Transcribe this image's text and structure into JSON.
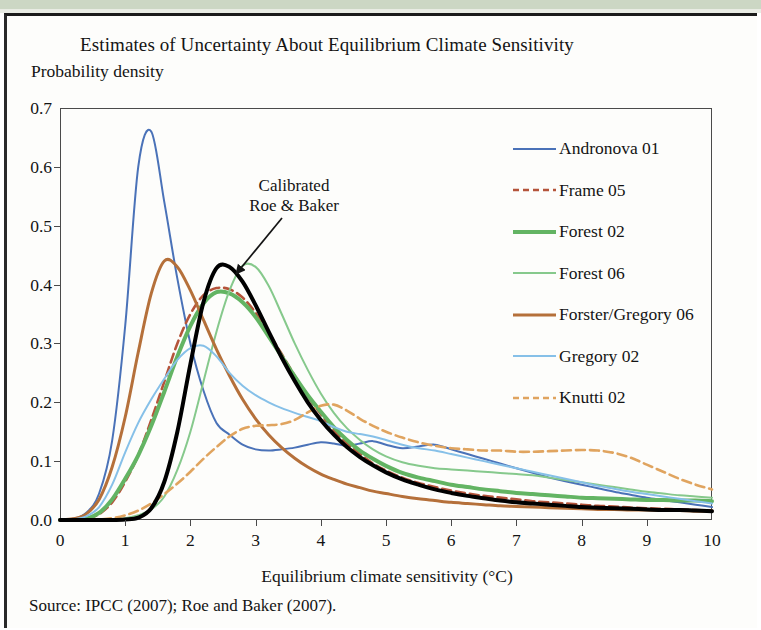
{
  "figure": {
    "title": "Estimates of Uncertainty About Equilibrium Climate Sensitivity",
    "y_axis_title": "Probability density",
    "x_axis_title": "Equilibrium climate sensitivity (°C)",
    "source_note": "Source: IPCC (2007); Roe and Baker (2007).",
    "annotation_line1": "Calibrated",
    "annotation_line2": "Roe & Baker"
  },
  "chart_data": {
    "type": "line",
    "title": "Estimates of Uncertainty About Equilibrium Climate Sensitivity",
    "xlabel": "Equilibrium climate sensitivity (°C)",
    "ylabel": "Probability density",
    "xlim": [
      0,
      10
    ],
    "ylim": [
      0,
      0.7
    ],
    "xticks": [
      "0",
      "1",
      "2",
      "3",
      "4",
      "5",
      "6",
      "7",
      "8",
      "9",
      "10"
    ],
    "yticks": [
      "0.0",
      "0.1",
      "0.2",
      "0.3",
      "0.4",
      "0.5",
      "0.6",
      "0.7"
    ],
    "grid": false,
    "legend_position": "right",
    "x": [
      0.0,
      0.2,
      0.4,
      0.6,
      0.8,
      1.0,
      1.2,
      1.4,
      1.6,
      1.8,
      2.0,
      2.2,
      2.4,
      2.6,
      2.8,
      3.0,
      3.2,
      3.4,
      3.6,
      3.8,
      4.0,
      4.2,
      4.4,
      4.6,
      4.8,
      5.0,
      5.25,
      5.5,
      5.75,
      6.0,
      6.25,
      6.5,
      6.75,
      7.0,
      7.25,
      7.5,
      7.75,
      8.0,
      8.25,
      8.5,
      8.75,
      9.0,
      9.25,
      9.5,
      9.75,
      10.0
    ],
    "series": [
      {
        "name": "Andronova 01",
        "color": "#4a72b8",
        "style": "solid",
        "width": 2.0,
        "peak_x": 1.3,
        "peak_y": 0.665,
        "values": [
          0.0,
          0.002,
          0.012,
          0.045,
          0.135,
          0.33,
          0.6,
          0.66,
          0.54,
          0.41,
          0.3,
          0.22,
          0.165,
          0.145,
          0.128,
          0.12,
          0.118,
          0.12,
          0.123,
          0.128,
          0.132,
          0.13,
          0.126,
          0.13,
          0.134,
          0.128,
          0.122,
          0.125,
          0.128,
          0.12,
          0.112,
          0.104,
          0.096,
          0.088,
          0.08,
          0.072,
          0.066,
          0.06,
          0.054,
          0.048,
          0.043,
          0.038,
          0.034,
          0.03,
          0.026,
          0.022
        ]
      },
      {
        "name": "Frame 05",
        "color": "#b5543a",
        "style": "dashed",
        "width": 2.6,
        "peak_x": 2.35,
        "peak_y": 0.395,
        "values": [
          0.0,
          0.0,
          0.002,
          0.01,
          0.03,
          0.065,
          0.11,
          0.17,
          0.235,
          0.3,
          0.35,
          0.382,
          0.394,
          0.392,
          0.378,
          0.352,
          0.318,
          0.282,
          0.245,
          0.21,
          0.18,
          0.152,
          0.13,
          0.112,
          0.096,
          0.084,
          0.072,
          0.063,
          0.056,
          0.05,
          0.045,
          0.041,
          0.038,
          0.035,
          0.032,
          0.03,
          0.028,
          0.026,
          0.024,
          0.023,
          0.021,
          0.02,
          0.019,
          0.018,
          0.017,
          0.016
        ]
      },
      {
        "name": "Forest 02",
        "color": "#63b463",
        "style": "solid",
        "width": 4.0,
        "peak_x": 2.4,
        "peak_y": 0.388,
        "values": [
          0.0,
          0.0,
          0.002,
          0.012,
          0.035,
          0.07,
          0.11,
          0.16,
          0.218,
          0.278,
          0.33,
          0.368,
          0.387,
          0.385,
          0.37,
          0.345,
          0.312,
          0.278,
          0.244,
          0.212,
          0.184,
          0.158,
          0.136,
          0.118,
          0.104,
          0.092,
          0.08,
          0.072,
          0.066,
          0.06,
          0.056,
          0.052,
          0.049,
          0.046,
          0.044,
          0.042,
          0.04,
          0.038,
          0.037,
          0.036,
          0.035,
          0.034,
          0.034,
          0.033,
          0.033,
          0.032
        ]
      },
      {
        "name": "Forest 06",
        "color": "#86c98c",
        "style": "solid",
        "width": 2.0,
        "peak_x": 2.92,
        "peak_y": 0.437,
        "values": [
          0.0,
          0.0,
          0.0,
          0.0,
          0.001,
          0.003,
          0.008,
          0.018,
          0.04,
          0.085,
          0.15,
          0.235,
          0.32,
          0.39,
          0.432,
          0.43,
          0.398,
          0.35,
          0.3,
          0.255,
          0.215,
          0.182,
          0.156,
          0.136,
          0.12,
          0.108,
          0.098,
          0.092,
          0.088,
          0.086,
          0.084,
          0.082,
          0.08,
          0.078,
          0.076,
          0.072,
          0.068,
          0.064,
          0.06,
          0.056,
          0.052,
          0.048,
          0.045,
          0.042,
          0.04,
          0.038
        ]
      },
      {
        "name": "Forster/Gregory 06",
        "color": "#b5703a",
        "style": "solid",
        "width": 3.0,
        "peak_x": 1.62,
        "peak_y": 0.443,
        "values": [
          0.0,
          0.002,
          0.01,
          0.035,
          0.09,
          0.175,
          0.285,
          0.385,
          0.44,
          0.43,
          0.39,
          0.34,
          0.29,
          0.245,
          0.205,
          0.172,
          0.145,
          0.123,
          0.105,
          0.09,
          0.078,
          0.069,
          0.061,
          0.055,
          0.049,
          0.045,
          0.04,
          0.036,
          0.033,
          0.03,
          0.028,
          0.026,
          0.024,
          0.023,
          0.022,
          0.021,
          0.02,
          0.019,
          0.018,
          0.018,
          0.017,
          0.017,
          0.016,
          0.016,
          0.015,
          0.015
        ]
      },
      {
        "name": "Gregory 02",
        "color": "#86c0e8",
        "style": "solid",
        "width": 2.0,
        "peak_x": 2.15,
        "peak_y": 0.297,
        "values": [
          0.0,
          0.001,
          0.006,
          0.022,
          0.06,
          0.115,
          0.165,
          0.205,
          0.24,
          0.272,
          0.292,
          0.296,
          0.278,
          0.25,
          0.228,
          0.212,
          0.2,
          0.19,
          0.182,
          0.175,
          0.168,
          0.158,
          0.15,
          0.146,
          0.142,
          0.136,
          0.128,
          0.122,
          0.118,
          0.112,
          0.106,
          0.1,
          0.094,
          0.088,
          0.082,
          0.076,
          0.07,
          0.064,
          0.058,
          0.053,
          0.048,
          0.044,
          0.04,
          0.036,
          0.032,
          0.028
        ]
      },
      {
        "name": "Knutti 02",
        "color": "#e0a45f",
        "style": "dashed",
        "width": 2.6,
        "peak_x": 4.1,
        "peak_y": 0.196,
        "secondary_peak_x": 7.9,
        "secondary_peak_y": 0.119,
        "values": [
          0.0,
          0.0,
          0.0,
          0.001,
          0.003,
          0.008,
          0.016,
          0.028,
          0.044,
          0.062,
          0.082,
          0.104,
          0.124,
          0.142,
          0.155,
          0.16,
          0.161,
          0.163,
          0.17,
          0.183,
          0.194,
          0.196,
          0.186,
          0.172,
          0.16,
          0.15,
          0.14,
          0.132,
          0.126,
          0.122,
          0.12,
          0.118,
          0.118,
          0.116,
          0.116,
          0.117,
          0.118,
          0.119,
          0.118,
          0.114,
          0.106,
          0.094,
          0.082,
          0.07,
          0.06,
          0.052
        ]
      },
      {
        "name": "Calibrated Roe & Baker",
        "color": "#000000",
        "style": "solid",
        "width": 4.0,
        "peak_x": 2.42,
        "peak_y": 0.432,
        "in_legend": false,
        "values": [
          0.0,
          0.0,
          0.0,
          0.0,
          0.0,
          0.001,
          0.004,
          0.02,
          0.065,
          0.15,
          0.265,
          0.37,
          0.428,
          0.43,
          0.405,
          0.365,
          0.32,
          0.276,
          0.236,
          0.2,
          0.17,
          0.145,
          0.124,
          0.107,
          0.093,
          0.081,
          0.069,
          0.06,
          0.052,
          0.046,
          0.041,
          0.037,
          0.033,
          0.03,
          0.028,
          0.026,
          0.024,
          0.022,
          0.021,
          0.02,
          0.019,
          0.018,
          0.017,
          0.017,
          0.016,
          0.015
        ]
      }
    ],
    "legend": [
      {
        "label": "Andronova 01",
        "color": "#4a72b8",
        "style": "solid",
        "width": 2.2
      },
      {
        "label": "Frame 05",
        "color": "#b5543a",
        "style": "dashed",
        "width": 2.6
      },
      {
        "label": "Forest 02",
        "color": "#63b463",
        "style": "solid",
        "width": 4.0
      },
      {
        "label": "Forest 06",
        "color": "#86c98c",
        "style": "solid",
        "width": 2.2
      },
      {
        "label": "Forster/Gregory 06",
        "color": "#b5703a",
        "style": "solid",
        "width": 3.0
      },
      {
        "label": "Gregory 02",
        "color": "#86c0e8",
        "style": "solid",
        "width": 2.2
      },
      {
        "label": "Knutti 02",
        "color": "#e0a45f",
        "style": "dashed",
        "width": 2.6
      }
    ]
  }
}
